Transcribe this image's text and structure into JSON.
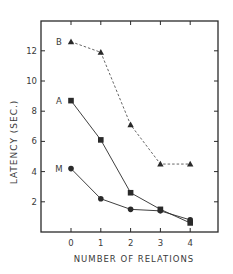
{
  "chart_data": {
    "type": "line",
    "title": "",
    "xlabel": "NUMBER OF RELATIONS",
    "ylabel": "LATENCY (SEC.)",
    "x": [
      0,
      1,
      2,
      3,
      4
    ],
    "x_ticks": [
      "0",
      "1",
      "2",
      "3",
      "4"
    ],
    "y_ticks": [
      "2",
      "4",
      "6",
      "8",
      "10",
      "12"
    ],
    "ylim": [
      0,
      14
    ],
    "xlim": [
      -0.9,
      4.9
    ],
    "grid": false,
    "legend": "inline labels at left of each series",
    "series": [
      {
        "name": "B",
        "marker": "triangle",
        "line": "dashed",
        "values": [
          12.6,
          11.9,
          7.1,
          4.5,
          4.5
        ]
      },
      {
        "name": "A",
        "marker": "square",
        "line": "solid",
        "values": [
          8.7,
          6.1,
          2.6,
          1.5,
          0.6
        ]
      },
      {
        "name": "M",
        "marker": "circle",
        "line": "solid",
        "values": [
          4.2,
          2.2,
          1.5,
          1.4,
          0.8
        ]
      }
    ]
  },
  "colors": {
    "ink": "#2a2a2a",
    "background": "#ffffff"
  }
}
